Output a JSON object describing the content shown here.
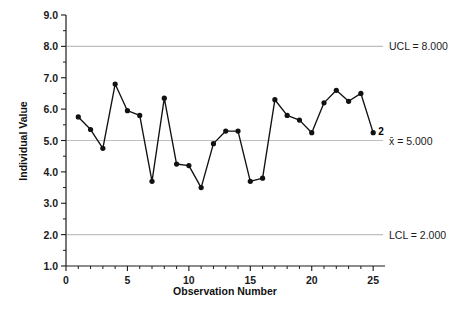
{
  "chart_data": {
    "type": "line",
    "title": "",
    "subtitle": "",
    "xlabel": "Observation Number",
    "ylabel": "Individual Value",
    "x": [
      1,
      2,
      3,
      4,
      5,
      6,
      7,
      8,
      9,
      10,
      11,
      12,
      13,
      14,
      15,
      16,
      17,
      18,
      19,
      20,
      21,
      22,
      23,
      24,
      25
    ],
    "values": [
      5.75,
      5.35,
      4.75,
      6.8,
      5.95,
      5.8,
      3.7,
      6.35,
      4.25,
      4.2,
      3.5,
      4.9,
      5.3,
      5.3,
      3.7,
      3.8,
      6.3,
      5.8,
      5.65,
      5.25,
      6.2,
      6.6,
      6.25,
      6.5,
      5.25
    ],
    "series": [
      {
        "name": "Individual Value",
        "values": [
          5.75,
          5.35,
          4.75,
          6.8,
          5.95,
          5.8,
          3.7,
          6.35,
          4.25,
          4.2,
          3.5,
          4.9,
          5.3,
          5.3,
          3.7,
          3.8,
          6.3,
          5.8,
          5.65,
          5.25,
          6.2,
          6.6,
          6.25,
          6.5,
          5.25
        ]
      }
    ],
    "xlim": [
      0,
      25.8
    ],
    "ylim": [
      1.0,
      9.0
    ],
    "xticks": [
      0,
      1,
      2,
      3,
      4,
      5,
      6,
      7,
      8,
      9,
      10,
      11,
      12,
      13,
      14,
      15,
      16,
      17,
      18,
      19,
      20,
      21,
      22,
      23,
      24,
      25
    ],
    "xtick_labels": [
      "0",
      "5",
      "10",
      "15",
      "20",
      "25"
    ],
    "xtick_label_values": [
      0,
      5,
      10,
      15,
      20,
      25
    ],
    "yticks_major": [
      1.0,
      2.0,
      3.0,
      4.0,
      5.0,
      6.0,
      7.0,
      8.0,
      9.0
    ],
    "ytick_labels": [
      "1.0",
      "2.0",
      "3.0",
      "4.0",
      "5.0",
      "6.0",
      "7.0",
      "8.0",
      "9.0"
    ],
    "yticks_minor": [
      1.5,
      2.5,
      3.5,
      4.5,
      5.5,
      6.5,
      7.5,
      8.5
    ],
    "grid": false,
    "legend": "none",
    "control_limits": [
      {
        "id": "ucl",
        "label": "UCL = 8.000",
        "value": 8.0
      },
      {
        "id": "center",
        "label": "x̄ = 5.000",
        "value": 5.0
      },
      {
        "id": "lcl",
        "label": "LCL = 2.000",
        "value": 2.0
      }
    ],
    "annotations": [
      {
        "id": "violation-25",
        "label": "2",
        "x": 25,
        "y": 5.25
      }
    ],
    "colors": {
      "series_line": "#111111",
      "series_marker": "#111111",
      "limit_line": "#bfbfbf",
      "axis": "#1b1b1b",
      "text": "#1b1b1b",
      "background": "#ffffff"
    }
  }
}
